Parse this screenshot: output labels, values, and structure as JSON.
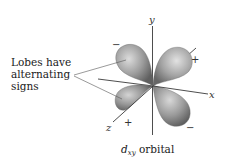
{
  "figure": {
    "callout": {
      "lines": [
        "Lobes have",
        "alternating",
        "signs"
      ]
    },
    "caption": {
      "orbital_symbol": "d",
      "orbital_subscript": "xy",
      "orbital_word": "orbital"
    },
    "axes": {
      "x_label": "x",
      "y_label": "y",
      "z_label": "z"
    },
    "lobes": [
      {
        "position": "upper-left",
        "sign": "−"
      },
      {
        "position": "upper-right",
        "sign": "+"
      },
      {
        "position": "lower-left",
        "sign": "+"
      },
      {
        "position": "lower-right",
        "sign": "−"
      }
    ],
    "colors": {
      "lobe_fill": "#9a9a9a",
      "lobe_highlight": "#d8d8d8",
      "lobe_shadow": "#5e5e5e",
      "axis": "#3a3a3a",
      "text": "#1a1a1a"
    }
  }
}
